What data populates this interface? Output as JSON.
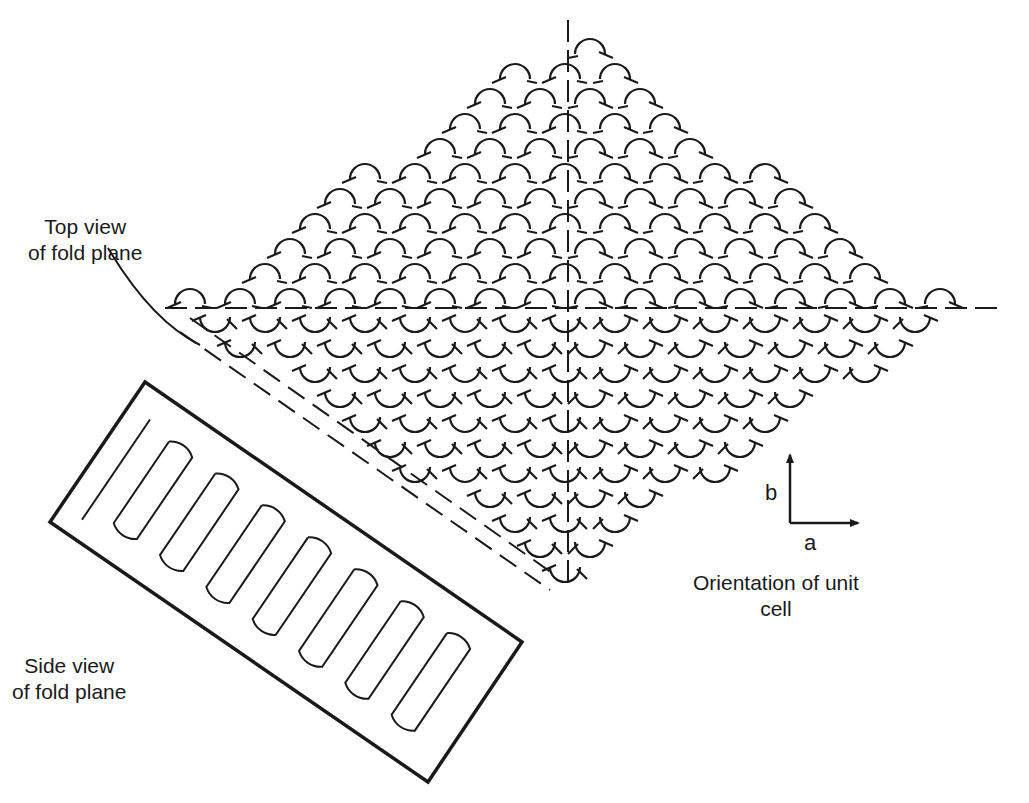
{
  "figure": {
    "labels": {
      "top_view": "Top view\nof fold plane",
      "side_view": "Side view\nof fold plane",
      "orientation": "Orientation of unit\ncell",
      "axis_a": "a",
      "axis_b": "b"
    },
    "colors": {
      "ink": "#1a1a1a",
      "background": "#ffffff"
    },
    "top_view_diamond": {
      "top": [
        568,
        20
      ],
      "left": [
        165,
        308
      ],
      "right": [
        975,
        308
      ],
      "bottom": [
        568,
        590
      ],
      "vertical_axis": {
        "x": 568,
        "y1": 20,
        "y2": 590
      },
      "horizontal_axis": {
        "y": 308,
        "x1": 165,
        "x2": 1000
      },
      "fold_plane_lines": [
        {
          "x1": 190,
          "y1": 318,
          "x2": 555,
          "y2": 575
        },
        {
          "x1": 180,
          "y1": 332,
          "x2": 550,
          "y2": 590
        }
      ],
      "arc_spacing": 50,
      "arc_symbol": "folded-chain-arc-with-arrow"
    },
    "side_view_box": {
      "corners": [
        [
          145,
          382
        ],
        [
          522,
          642
        ],
        [
          428,
          782
        ],
        [
          50,
          522
        ]
      ],
      "folds": 7
    },
    "unit_cell_axes": {
      "origin": [
        790,
        523
      ],
      "b_end": [
        790,
        455
      ],
      "a_end": [
        858,
        523
      ]
    }
  }
}
